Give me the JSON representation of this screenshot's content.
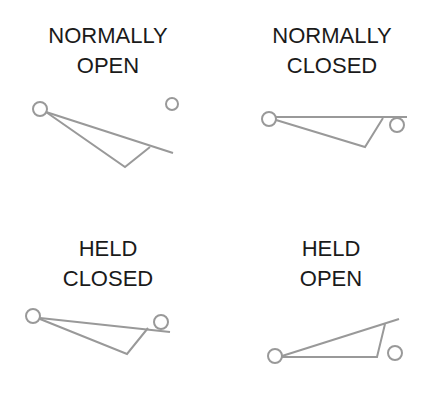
{
  "colors": {
    "text": "#1a1a1a",
    "line": "#999999",
    "background": "#ffffff"
  },
  "panels": [
    {
      "id": "normally-open",
      "title_lines": [
        "NORMALLY",
        "OPEN"
      ],
      "label_pos": {
        "left": 18,
        "top": 21
      },
      "circles": [
        {
          "cx": 40,
          "cy": 109,
          "r": 7
        },
        {
          "cx": 172,
          "cy": 104,
          "r": 6
        }
      ],
      "lines": [
        [
          46,
          112,
          173,
          153
        ]
      ],
      "polyline": "46,112 125,167 150,147"
    },
    {
      "id": "normally-closed",
      "title_lines": [
        "NORMALLY",
        "CLOSED"
      ],
      "label_pos": {
        "left": 242,
        "top": 21
      },
      "circles": [
        {
          "cx": 269,
          "cy": 119,
          "r": 7
        },
        {
          "cx": 397,
          "cy": 125,
          "r": 7
        }
      ],
      "lines": [
        [
          276,
          117,
          407,
          117
        ]
      ],
      "polyline": "276,120 365,147 383,118"
    },
    {
      "id": "held-closed",
      "title_lines": [
        "HELD",
        "CLOSED"
      ],
      "label_pos": {
        "left": 18,
        "top": 234
      },
      "circles": [
        {
          "cx": 33,
          "cy": 316,
          "r": 7
        },
        {
          "cx": 161,
          "cy": 322,
          "r": 7
        }
      ],
      "lines": [
        [
          40,
          318,
          170,
          332
        ]
      ],
      "polyline": "40,319 127,354 148,328"
    },
    {
      "id": "held-open",
      "title_lines": [
        "HELD",
        "OPEN"
      ],
      "label_pos": {
        "left": 241,
        "top": 234
      },
      "circles": [
        {
          "cx": 275,
          "cy": 356,
          "r": 7
        },
        {
          "cx": 395,
          "cy": 353,
          "r": 7
        }
      ],
      "lines": [
        [
          282,
          356,
          399,
          319
        ]
      ],
      "polyline": "282,357 377,357 385,324"
    }
  ]
}
